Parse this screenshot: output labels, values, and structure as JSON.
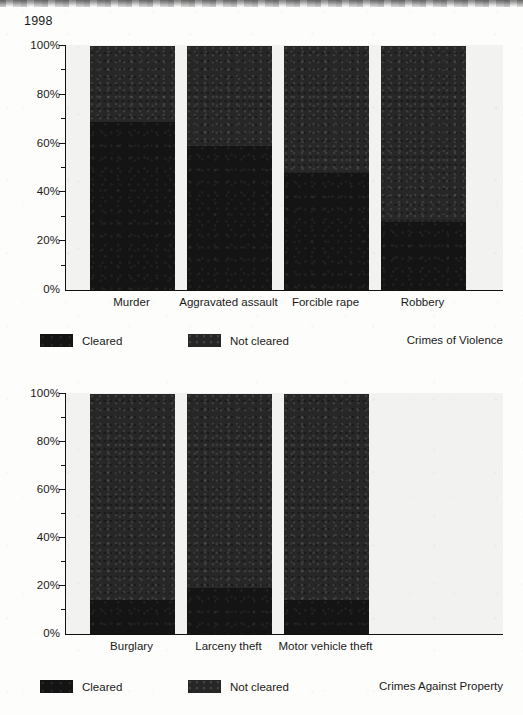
{
  "page": {
    "year_label": "1998",
    "background_color": "#fdfdfb",
    "plot_background_color": "#f2f2f0",
    "axis_color": "#111111"
  },
  "series_colors": {
    "cleared": "#141414",
    "not_cleared": "#272727"
  },
  "legend": {
    "cleared_label": "Cleared",
    "not_cleared_label": "Not cleared"
  },
  "panels": [
    {
      "id": "violence",
      "caption": "Crimes of Violence",
      "y_tick_labels": [
        "100%",
        "80%",
        "60%",
        "40%",
        "20%",
        "0%"
      ]
    },
    {
      "id": "property",
      "caption": "Crimes Against Property",
      "y_tick_labels": [
        "100%",
        "80%",
        "60%",
        "40%",
        "20%",
        "0%"
      ]
    }
  ],
  "chart_data": [
    {
      "type": "bar",
      "title": "Crimes of Violence",
      "subtitle": "1998",
      "stacked": true,
      "xlabel": "",
      "ylabel": "",
      "ylim": [
        0,
        100
      ],
      "y_ticks": [
        0,
        20,
        40,
        60,
        80,
        100
      ],
      "y_tick_labels": [
        "0%",
        "20%",
        "40%",
        "60%",
        "80%",
        "100%"
      ],
      "y_minor_ticks": [
        10,
        30,
        50,
        70,
        90
      ],
      "grid": false,
      "legend_position": "below-left",
      "categories": [
        "Murder",
        "Aggravated assault",
        "Forcible rape",
        "Robbery"
      ],
      "series": [
        {
          "name": "Cleared",
          "values": [
            69,
            59,
            48,
            28
          ]
        },
        {
          "name": "Not cleared",
          "values": [
            31,
            41,
            52,
            72
          ]
        }
      ]
    },
    {
      "type": "bar",
      "title": "Crimes Against Property",
      "subtitle": "1998",
      "stacked": true,
      "xlabel": "",
      "ylabel": "",
      "ylim": [
        0,
        100
      ],
      "y_ticks": [
        0,
        20,
        40,
        60,
        80,
        100
      ],
      "y_tick_labels": [
        "0%",
        "20%",
        "40%",
        "60%",
        "80%",
        "100%"
      ],
      "y_minor_ticks": [
        10,
        30,
        50,
        70,
        90
      ],
      "grid": false,
      "legend_position": "below-left",
      "categories": [
        "Burglary",
        "Larceny theft",
        "Motor vehicle theft"
      ],
      "series": [
        {
          "name": "Cleared",
          "values": [
            14,
            19,
            14
          ]
        },
        {
          "name": "Not cleared",
          "values": [
            86,
            81,
            86
          ]
        }
      ]
    }
  ]
}
